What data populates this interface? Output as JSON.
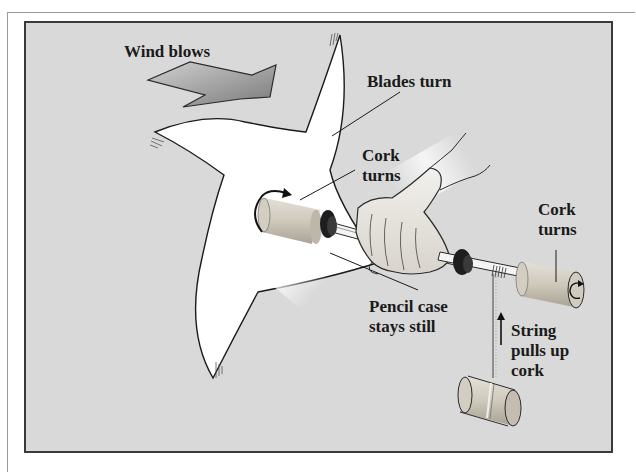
{
  "diagram": {
    "colors": {
      "background_panel": "#d9d9d9",
      "blade_fill": "#ffffff",
      "outline": "#1a1a1a",
      "cork": "#c9c4b8",
      "arrow_fill": "#9a9a9a"
    },
    "labels": {
      "wind": "Wind blows",
      "blades": "Blades turn",
      "cork_left_1": "Cork",
      "cork_left_2": "turns",
      "cork_right_1": "Cork",
      "cork_right_2": "turns",
      "pencil_1": "Pencil case",
      "pencil_2": "stays still",
      "string_1": "String",
      "string_2": "pulls up",
      "string_3": "cork"
    },
    "components": [
      {
        "name": "wind-arrow",
        "icon": "big-arrow-right"
      },
      {
        "name": "pinwheel-blades",
        "icon": "four-blade-pinwheel"
      },
      {
        "name": "cork-front",
        "icon": "cylinder-with-rotation-arrow"
      },
      {
        "name": "hand",
        "icon": "hand-holding-pencil-case"
      },
      {
        "name": "pencil-case",
        "icon": "tube"
      },
      {
        "name": "cork-back",
        "icon": "cylinder-with-rotation-arrow"
      },
      {
        "name": "string",
        "icon": "vertical-string"
      },
      {
        "name": "hanging-cork",
        "icon": "cylinder"
      }
    ]
  }
}
